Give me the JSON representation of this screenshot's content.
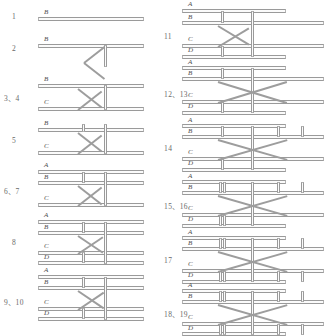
{
  "diagram": {
    "bar_labels": [
      "A",
      "B",
      "C",
      "D"
    ],
    "line_color": "#9a9a9a",
    "label_color": "#4d4d4d",
    "background": "#ffffff",
    "separator": "、"
  },
  "columns": [
    {
      "name": "left-column",
      "figures": [
        {
          "number": "1",
          "labels": [
            "B"
          ],
          "bars": 1,
          "bracing": "none",
          "description": "single horizontal chord B"
        },
        {
          "number": "2",
          "labels": [
            "B"
          ],
          "bars": 1,
          "bracing": "zigzag-below",
          "description": "chord B with zigzag brace and end post below"
        },
        {
          "number": "3、4",
          "labels": [
            "B",
            "C"
          ],
          "bars": 2,
          "bracing": "zigzag",
          "description": "chords B and C joined by zigzag brace and end post"
        },
        {
          "number": "5",
          "labels": [
            "B",
            "C"
          ],
          "bars": 2,
          "bracing": "zigzag-with-posts",
          "description": "chords B and C with intermediate post and zigzag brace"
        },
        {
          "number": "6、7",
          "labels": [
            "A",
            "B",
            "C"
          ],
          "bars": 3,
          "bracing": "zigzag-with-posts",
          "description": "chords A, B paired at top, C below with zigzag brace"
        },
        {
          "number": "8",
          "labels": [
            "A",
            "B",
            "C",
            "D"
          ],
          "bars": 4,
          "bracing": "zigzag-with-posts",
          "description": "paired chords A-B and C-D with zigzag brace between"
        },
        {
          "number": "9、10",
          "labels": [
            "A",
            "B",
            "C",
            "D"
          ],
          "bars": 4,
          "bracing": "zigzag-with-posts",
          "description": "paired chords A-B and C-D, zigzag brace, extra posts"
        }
      ]
    },
    {
      "name": "right-column",
      "figures": [
        {
          "number": "11",
          "labels": [
            "A",
            "B",
            "C",
            "D"
          ],
          "bars": 4,
          "bracing": "zigzag-with-posts",
          "description": "paired chords A-B and C-D with zigzag brace"
        },
        {
          "number": "12、13",
          "labels": [
            "A",
            "B",
            "C",
            "D"
          ],
          "bars": 4,
          "bracing": "x-cross",
          "description": "paired chords with X cross-bracing extending right"
        },
        {
          "number": "14",
          "labels": [
            "A",
            "B",
            "C",
            "D"
          ],
          "bars": 4,
          "bracing": "x-cross-with-posts",
          "description": "X cross-bracing with additional outer posts"
        },
        {
          "number": "15、16",
          "labels": [
            "A",
            "B",
            "C",
            "D"
          ],
          "bars": 4,
          "bracing": "x-cross-with-posts",
          "description": "X cross-bracing, doubled posts at bay ends"
        },
        {
          "number": "17",
          "labels": [
            "A",
            "B",
            "C",
            "D"
          ],
          "bars": 4,
          "bracing": "x-cross-with-posts",
          "description": "X cross-bracing with posts on both bays"
        },
        {
          "number": "18、19",
          "labels": [
            "A",
            "B",
            "C",
            "D"
          ],
          "bars": 4,
          "bracing": "x-cross-with-posts",
          "description": "full frame, X cross-bracing and multiple posts"
        }
      ]
    }
  ]
}
